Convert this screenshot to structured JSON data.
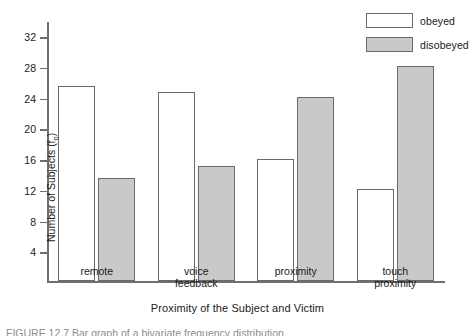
{
  "chart_data": {
    "type": "bar",
    "title": "",
    "xlabel": "Proximity of the Subject and Victim",
    "ylabel": "Number of Subjects (f",
    "ylabel_sub": "o",
    "ylabel_suffix": ")",
    "categories": [
      "remote",
      "voice\nfeedback",
      "proximity",
      "touch\nproximity"
    ],
    "series": [
      {
        "name": "obeyed",
        "values": [
          25.5,
          24.7,
          16,
          12
        ],
        "fill": "#ffffff"
      },
      {
        "name": "disobeyed",
        "values": [
          13.5,
          15,
          24,
          28
        ],
        "fill": "#c9c9c9"
      }
    ],
    "ylim": [
      0,
      34
    ],
    "yticks": [
      4,
      8,
      12,
      16,
      20,
      24,
      28,
      32
    ],
    "ytick_labels": [
      "4",
      "8",
      "12",
      "16",
      "20",
      "24",
      "28",
      "32"
    ],
    "grid": false,
    "legend_position": "top-right"
  },
  "legend": {
    "items": [
      {
        "label": "obeyed",
        "swatch": "white-rect"
      },
      {
        "label": "disobeyed",
        "swatch": "gray-rect"
      }
    ]
  },
  "caption": {
    "text": "FIGURE 12.7  Bar graph of a bivariate frequency distribution"
  },
  "colors": {
    "bar_fill_obeyed": "#ffffff",
    "bar_fill_disobeyed": "#c9c9c9",
    "bar_stroke": "#6a6a6a",
    "axis": "#6f6f6f",
    "text": "#1a1a1a"
  }
}
